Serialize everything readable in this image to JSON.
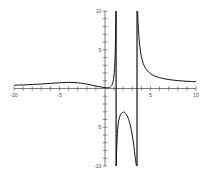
{
  "chart_data": {
    "type": "line",
    "title": "",
    "subtitle": "",
    "xlabel": "",
    "ylabel": "",
    "xlim": [
      -10,
      10
    ],
    "ylim": [
      -10,
      10
    ],
    "grid": false,
    "legend": null,
    "axis_color": "#5a5a5a",
    "curve_color": "#111111",
    "background_color": "#ffffff",
    "x_ticks": [
      -10,
      -9,
      -8,
      -7,
      -6,
      -5,
      -4,
      -3,
      -2,
      -1,
      1,
      2,
      3,
      4,
      5,
      6,
      7,
      8,
      9,
      10
    ],
    "x_tick_labels": [
      {
        "value": -10,
        "text": "-10"
      },
      {
        "value": -5,
        "text": "-5"
      },
      {
        "value": 5,
        "text": "5"
      },
      {
        "value": 10,
        "text": "10"
      }
    ],
    "y_ticks": [
      -10,
      -9,
      -8,
      -7,
      -6,
      -5,
      -4,
      -3,
      -2,
      -1,
      1,
      2,
      3,
      4,
      5,
      6,
      7,
      8,
      9,
      10
    ],
    "y_tick_labels": [
      {
        "value": 10,
        "text": "10"
      },
      {
        "value": 5,
        "text": "5"
      },
      {
        "value": -5,
        "text": "-5"
      },
      {
        "value": -10,
        "text": "-10"
      }
    ],
    "asymptotes": [
      {
        "orientation": "vertical",
        "x": 1.22
      },
      {
        "orientation": "vertical",
        "x": 3.52
      }
    ],
    "series": [
      {
        "name": "branch-left",
        "description": "left branch approaching zero from above as x decreases",
        "points": [
          [
            -10.0,
            0.42
          ],
          [
            -9.5,
            0.44
          ],
          [
            -9.0,
            0.46
          ],
          [
            -8.5,
            0.49
          ],
          [
            -8.0,
            0.52
          ],
          [
            -7.5,
            0.55
          ],
          [
            -7.0,
            0.58
          ],
          [
            -6.5,
            0.62
          ],
          [
            -6.0,
            0.66
          ],
          [
            -5.5,
            0.7
          ],
          [
            -5.0,
            0.74
          ],
          [
            -4.5,
            0.77
          ],
          [
            -4.0,
            0.79
          ],
          [
            -3.5,
            0.78
          ],
          [
            -3.0,
            0.74
          ],
          [
            -2.5,
            0.67
          ],
          [
            -2.0,
            0.57
          ],
          [
            -1.5,
            0.45
          ],
          [
            -1.0,
            0.32
          ],
          [
            -0.5,
            0.2
          ],
          [
            0.0,
            0.11
          ],
          [
            0.2,
            0.09
          ],
          [
            0.4,
            0.1
          ],
          [
            0.6,
            0.2
          ],
          [
            0.75,
            0.42
          ],
          [
            0.88,
            0.85
          ],
          [
            0.98,
            1.6
          ],
          [
            1.05,
            2.6
          ],
          [
            1.1,
            3.8
          ],
          [
            1.14,
            5.4
          ],
          [
            1.17,
            7.2
          ],
          [
            1.19,
            8.8
          ],
          [
            1.21,
            10.0
          ]
        ]
      },
      {
        "name": "branch-middle",
        "description": "middle branch between the two asymptotes, local maximum near y = -3",
        "points": [
          [
            1.24,
            -10.0
          ],
          [
            1.27,
            -8.4
          ],
          [
            1.31,
            -7.0
          ],
          [
            1.36,
            -5.8
          ],
          [
            1.42,
            -4.9
          ],
          [
            1.5,
            -4.2
          ],
          [
            1.6,
            -3.7
          ],
          [
            1.72,
            -3.35
          ],
          [
            1.85,
            -3.15
          ],
          [
            2.0,
            -3.05
          ],
          [
            2.15,
            -3.08
          ],
          [
            2.3,
            -3.25
          ],
          [
            2.45,
            -3.55
          ],
          [
            2.6,
            -4.0
          ],
          [
            2.75,
            -4.6
          ],
          [
            2.9,
            -5.4
          ],
          [
            3.05,
            -6.4
          ],
          [
            3.18,
            -7.5
          ],
          [
            3.3,
            -8.7
          ],
          [
            3.4,
            -9.6
          ],
          [
            3.46,
            -10.0
          ]
        ]
      },
      {
        "name": "branch-right",
        "description": "right branch decaying from +infinity toward a small positive value",
        "points": [
          [
            3.58,
            10.0
          ],
          [
            3.64,
            8.4
          ],
          [
            3.72,
            6.8
          ],
          [
            3.82,
            5.5
          ],
          [
            3.95,
            4.4
          ],
          [
            4.1,
            3.6
          ],
          [
            4.3,
            2.95
          ],
          [
            4.55,
            2.45
          ],
          [
            4.85,
            2.05
          ],
          [
            5.2,
            1.76
          ],
          [
            5.6,
            1.55
          ],
          [
            6.0,
            1.4
          ],
          [
            6.5,
            1.26
          ],
          [
            7.0,
            1.16
          ],
          [
            7.5,
            1.08
          ],
          [
            8.0,
            1.02
          ],
          [
            8.5,
            0.97
          ],
          [
            9.0,
            0.93
          ],
          [
            9.5,
            0.9
          ],
          [
            10.0,
            0.88
          ]
        ]
      }
    ]
  }
}
